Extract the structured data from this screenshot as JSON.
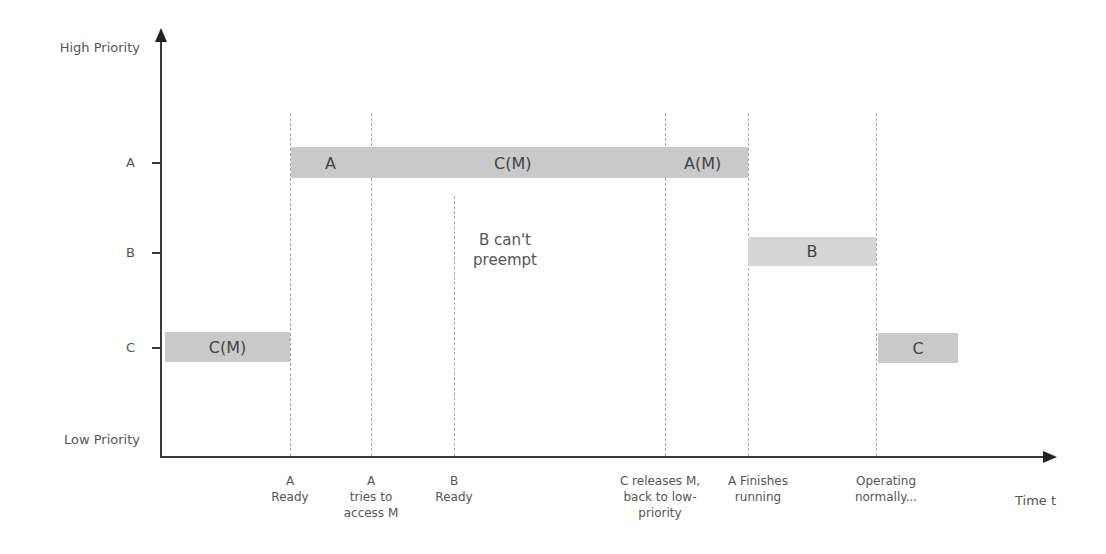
{
  "diagram": {
    "y_axis": {
      "top_label": "High Priority",
      "bottom_label": "Low Priority",
      "levels": [
        "A",
        "B",
        "C"
      ]
    },
    "x_axis": {
      "label": "Time t",
      "events": [
        "A\nReady",
        "A\ntries to\naccess M",
        "B\nReady",
        "C releases M,\nback to low-\npriority",
        "A Finishes\nrunning",
        "Operating\nnormally..."
      ]
    },
    "bars": [
      {
        "level": "C",
        "label": "C(M)"
      },
      {
        "level": "A",
        "label": "A"
      },
      {
        "level": "A",
        "label": "C(M)"
      },
      {
        "level": "A",
        "label": "A(M)"
      },
      {
        "level": "B",
        "label": "B"
      },
      {
        "level": "C",
        "label": "C"
      }
    ],
    "annotation": "B can't\npreempt",
    "colors": {
      "bar": "#c9c9c9",
      "bar_light": "#d6d6d6",
      "axis": "#3a3a3a",
      "dashed_line": "#aaaaaa"
    }
  }
}
